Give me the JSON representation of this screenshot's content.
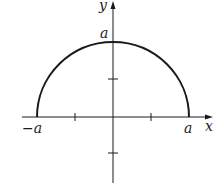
{
  "figure": {
    "type": "semicircle-graph",
    "curve": "y = sqrt(a^2 - x^2)",
    "labels": {
      "y_axis": "y",
      "x_axis": "x",
      "top": "a",
      "left": "−a",
      "right": "a"
    },
    "colors": {
      "stroke": "#1a1a1a",
      "background": "#ffffff"
    }
  }
}
